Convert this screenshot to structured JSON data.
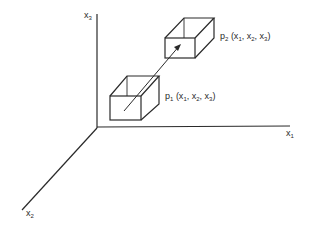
{
  "diagram": {
    "axes": {
      "x1": {
        "label": "x",
        "sub": "1"
      },
      "x2": {
        "label": "x",
        "sub": "2"
      },
      "x3": {
        "label": "x",
        "sub": "3"
      }
    },
    "points": {
      "p1": {
        "name": "p",
        "sub": "1",
        "coords": "(x",
        "c1": "1",
        "sep1": ", x",
        "c2": "2",
        "sep2": ", x",
        "c3": "3",
        "close": ")"
      },
      "p2": {
        "name": "p",
        "sub": "2",
        "coords": "(x",
        "c1": "1",
        "sep1": ", x",
        "c2": "2",
        "sep2": ", x",
        "c3": "3",
        "close": ")"
      }
    },
    "colors": {
      "line": "#2a2a2a",
      "background": "#ffffff"
    }
  }
}
